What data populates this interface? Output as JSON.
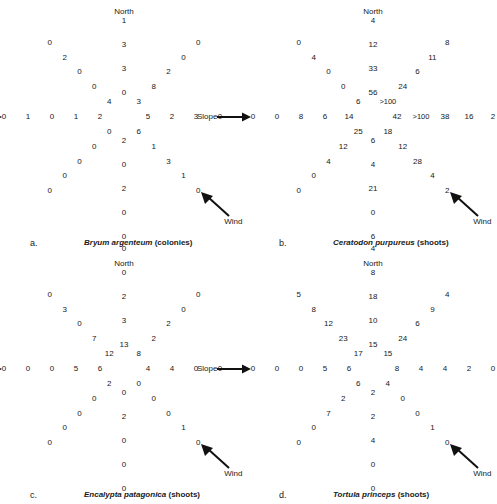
{
  "figure": {
    "labels": {
      "north": "North",
      "slope": "Slope",
      "wind": "Wind"
    }
  },
  "chart_data": [
    {
      "type": "radar-grid",
      "panel": "a",
      "letter": "a.",
      "title_species": "Bryum argenteum",
      "title_unit": "(colonies)",
      "title": "Bryum argenteum (colonies)",
      "directions": [
        "N",
        "NE",
        "E",
        "SE",
        "S",
        "SW",
        "W",
        "NW"
      ],
      "distance_steps": 5,
      "note": "values listed from center outward along each of 8 arms",
      "arms": {
        "N": [
          "0",
          "3",
          "3",
          "1",
          "0"
        ],
        "NE": [
          "3",
          "8",
          "2",
          "0",
          "0"
        ],
        "E": [
          "5",
          "2",
          "3",
          "0",
          "1"
        ],
        "SE": [
          "6",
          "1",
          "3",
          "1",
          "0"
        ],
        "S": [
          "2",
          "0",
          "2",
          "0",
          "0"
        ],
        "SW": [
          "0",
          "0",
          "0",
          "0",
          "0"
        ],
        "W": [
          "2",
          "1",
          "0",
          "1",
          "0"
        ],
        "NW": [
          "4",
          "0",
          "0",
          "2",
          "0"
        ]
      }
    },
    {
      "type": "radar-grid",
      "panel": "b",
      "letter": "b.",
      "title_species": "Ceratodon purpureus",
      "title_unit": "(shoots)",
      "title": "Ceratodon purpureus (shoots)",
      "directions": [
        "N",
        "NE",
        "E",
        "SE",
        "S",
        "SW",
        "W",
        "NW"
      ],
      "distance_steps": 5,
      "note": "values listed from center outward along each of 8 arms",
      "arms": {
        "N": [
          "56",
          "33",
          "12",
          "4",
          "4"
        ],
        "NE": [
          ">100",
          "24",
          "6",
          "11",
          "8"
        ],
        "E": [
          "42",
          ">100",
          "38",
          "16",
          "2"
        ],
        "SE": [
          "18",
          "12",
          "28",
          "4",
          "2"
        ],
        "S": [
          "6",
          "4",
          "21",
          "0",
          "6"
        ],
        "SW": [
          "25",
          "12",
          "4",
          "0",
          "0"
        ],
        "W": [
          "14",
          "6",
          "8",
          "0",
          "0"
        ],
        "NW": [
          "6",
          "0",
          "0",
          "4",
          "0"
        ]
      }
    },
    {
      "type": "radar-grid",
      "panel": "c",
      "letter": "c.",
      "title_species": "Encalypta patagonica",
      "title_unit": "(shoots)",
      "title": "Encalypta patagonica (shoots)",
      "directions": [
        "N",
        "NE",
        "E",
        "SE",
        "S",
        "SW",
        "W",
        "NW"
      ],
      "distance_steps": 5,
      "note": "values listed from center outward along each of 8 arms",
      "arms": {
        "N": [
          "13",
          "3",
          "2",
          "0",
          "0"
        ],
        "NE": [
          "8",
          "2",
          "2",
          "0",
          "0"
        ],
        "E": [
          "4",
          "4",
          "0",
          "0",
          "0"
        ],
        "SE": [
          "0",
          "0",
          "0",
          "1",
          "0"
        ],
        "S": [
          "0",
          "2",
          "0",
          "0",
          "0"
        ],
        "SW": [
          "2",
          "0",
          "0",
          "0",
          "0"
        ],
        "W": [
          "6",
          "5",
          "0",
          "0",
          "0"
        ],
        "NW": [
          "12",
          "7",
          "0",
          "3",
          "0"
        ]
      }
    },
    {
      "type": "radar-grid",
      "panel": "d",
      "letter": "d.",
      "title_species": "Tortula princeps",
      "title_unit": "(shoots)",
      "title": "Tortula princeps (shoots)",
      "directions": [
        "N",
        "NE",
        "E",
        "SE",
        "S",
        "SW",
        "W",
        "NW"
      ],
      "distance_steps": 5,
      "note": "values listed from center outward along each of 8 arms",
      "arms": {
        "N": [
          "15",
          "10",
          "18",
          "8",
          "4"
        ],
        "NE": [
          "15",
          "24",
          "6",
          "9",
          "4"
        ],
        "E": [
          "8",
          "4",
          "4",
          "2",
          "0"
        ],
        "SE": [
          "4",
          "0",
          "0",
          "1",
          "0"
        ],
        "S": [
          "2",
          "2",
          "4",
          "0",
          "0"
        ],
        "SW": [
          "6",
          "2",
          "7",
          "0",
          "0"
        ],
        "W": [
          "6",
          "5",
          "0",
          "0",
          "0"
        ],
        "NW": [
          "17",
          "23",
          "12",
          "8",
          "5"
        ]
      }
    }
  ]
}
